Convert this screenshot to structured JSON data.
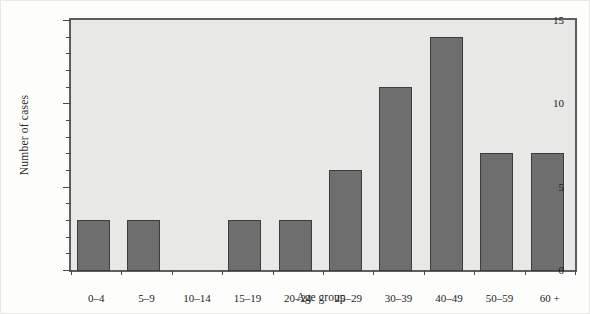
{
  "chart_data": {
    "type": "bar",
    "title": "",
    "xlabel": "Age group",
    "ylabel": "Number of cases",
    "categories": [
      "0–4",
      "5–9",
      "10–14",
      "15–19",
      "20–24",
      "25–29",
      "30–39",
      "40–49",
      "50–59",
      "60 +"
    ],
    "values": [
      3,
      3,
      0,
      3,
      3,
      6,
      11,
      14,
      7,
      7
    ],
    "ylim": [
      0,
      15
    ],
    "ytick_labels": [
      "0",
      "5",
      "10",
      "15"
    ],
    "ytick_values": [
      0,
      5,
      10,
      15
    ],
    "yminor_values": [
      1,
      2,
      3,
      4,
      6,
      7,
      8,
      9,
      11,
      12,
      13,
      14
    ],
    "grid": false,
    "legend": null,
    "colors": {
      "bar_fill": "#6e6e6e",
      "bar_edge": "#3c3c3c",
      "plot_background": "#e8e8e6",
      "frame": "#5e5e5e",
      "page_background": "#fdfdfc",
      "text": "#1c1c1c"
    }
  }
}
